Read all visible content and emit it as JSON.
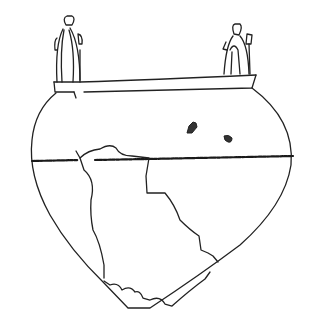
{
  "figure": {
    "background": "#ffffff",
    "stroke_color": "#222222",
    "parts": [
      "left-handle-figure",
      "right-handle-figure",
      "rim",
      "body-outline",
      "carination-line",
      "fracture-outline",
      "surface-marks"
    ]
  }
}
